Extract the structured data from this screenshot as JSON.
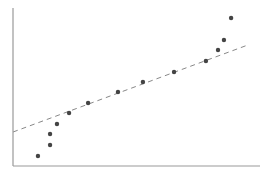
{
  "chart_data": {
    "type": "scatter",
    "title": "",
    "xlabel": "",
    "ylabel": "",
    "xlim": [
      0,
      100
    ],
    "ylim": [
      0,
      100
    ],
    "grid": false,
    "legend": null,
    "tick_labels": {
      "x": [],
      "y": []
    },
    "series": [
      {
        "name": "points",
        "color": "#444444",
        "x": [
          10.1,
          15.0,
          15.0,
          17.8,
          22.7,
          30.4,
          42.5,
          52.6,
          65.2,
          78.1,
          83.0,
          85.4,
          88.3
        ],
        "y": [
          6.3,
          13.3,
          20.3,
          26.6,
          33.5,
          39.9,
          46.8,
          53.2,
          59.5,
          66.5,
          73.4,
          79.7,
          93.7
        ]
      }
    ],
    "reference_line": {
      "style": "dashed",
      "color": "#888888",
      "x": [
        0,
        95.1
      ],
      "y": [
        21.5,
        76.6
      ]
    }
  },
  "layout": {
    "plot_left_px": 13,
    "plot_right_px": 260,
    "plot_top_px": 8,
    "plot_bottom_px": 166,
    "axis_color": "#999999",
    "point_radius_px": 2.2
  }
}
